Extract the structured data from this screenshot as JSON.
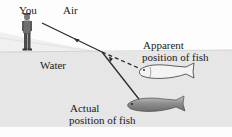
{
  "diagram": {
    "labels": {
      "observer": "You",
      "air": "Air",
      "water": "Water",
      "apparent_line1": "Apparent",
      "apparent_line2": "position of fish",
      "actual_line1": "Actual",
      "actual_line2": "position of fish"
    },
    "colors": {
      "water": "#e6e6e6",
      "air": "#fdfdfd",
      "ray": "#2a2a2a",
      "fish_actual": "#9a9a9a",
      "fish_apparent": "#f4f4f4"
    },
    "elements": [
      {
        "name": "observer-figure",
        "type": "person"
      },
      {
        "name": "refracted-ray-in-air",
        "style": "solid",
        "arrow": "toward observer"
      },
      {
        "name": "ray-in-water",
        "style": "solid",
        "arrow": "toward surface"
      },
      {
        "name": "apparent-ray-extension",
        "style": "dashed"
      },
      {
        "name": "apparent-fish",
        "shade": "light"
      },
      {
        "name": "actual-fish",
        "shade": "dark"
      }
    ]
  }
}
